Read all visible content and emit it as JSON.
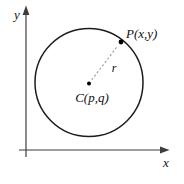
{
  "figure": {
    "labels": {
      "y_axis": "y",
      "x_axis": "x",
      "point": "P(x,y)",
      "radius": "r",
      "center": "C(p,q)"
    },
    "colors": {
      "background": "#ffffff",
      "circle": "#1c1c1c",
      "axis": "#3d3d3d",
      "radius_dashed": "#999999",
      "text": "#111111",
      "dot": "#000000"
    },
    "geometry": {
      "circle": {
        "cx": 89,
        "cy": 82.5,
        "r": 54
      },
      "center_dot": {
        "cx": 89,
        "cy": 83.5,
        "r": 2
      },
      "point_dot": {
        "cx": 121,
        "cy": 42,
        "r": 2.4
      },
      "radius_line": {
        "x1": 92,
        "y1": 79.5,
        "x2": 118,
        "y2": 45.5
      },
      "y_axis_line": {
        "x1": 26,
        "y1": 9,
        "x2": 26,
        "y2": 157
      },
      "x_axis_line": {
        "x1": 19,
        "y1": 150,
        "x2": 164,
        "y2": 150
      },
      "y_label_pos": {
        "x": 17,
        "y": 19
      },
      "x_label_pos": {
        "x": 166,
        "y": 167
      },
      "point_label_pos": {
        "x": 126,
        "y": 38
      },
      "radius_label_pos": {
        "x": 114,
        "y": 72
      },
      "center_label_pos": {
        "x": 92,
        "y": 102
      }
    }
  }
}
